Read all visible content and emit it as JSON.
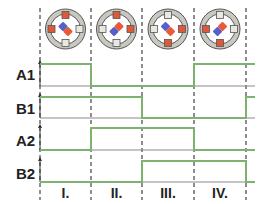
{
  "signals": [
    {
      "name": "A1",
      "label": "A1",
      "states": [
        1,
        0,
        0,
        1
      ],
      "high_y": 64,
      "low_y": 86,
      "label_y": 67
    },
    {
      "name": "B1",
      "label": "B1",
      "states": [
        1,
        1,
        0,
        0
      ],
      "high_y": 97,
      "low_y": 118,
      "label_y": 101
    },
    {
      "name": "A2",
      "label": "A2",
      "states": [
        0,
        1,
        1,
        0
      ],
      "high_y": 128,
      "low_y": 150,
      "label_y": 133
    },
    {
      "name": "B2",
      "label": "B2",
      "states": [
        0,
        0,
        1,
        1
      ],
      "high_y": 161,
      "low_y": 182,
      "label_y": 166
    }
  ],
  "phases": [
    {
      "label": "I.",
      "x_start": 40,
      "x_end": 91
    },
    {
      "label": "II.",
      "x_start": 91,
      "x_end": 142
    },
    {
      "label": "III.",
      "x_start": 142,
      "x_end": 194
    },
    {
      "label": "IV.",
      "x_start": 194,
      "x_end": 246
    }
  ],
  "after_last": {
    "A1": 1,
    "B1": 1,
    "A2": 0,
    "B2": 0,
    "x_end": 255
  },
  "motors": [
    {
      "phase": "I.",
      "energized": [
        "top",
        "left"
      ],
      "rotor_angle": 45
    },
    {
      "phase": "II.",
      "energized": [
        "top",
        "right"
      ],
      "rotor_angle": -45
    },
    {
      "phase": "III.",
      "energized": [
        "right",
        "bottom"
      ],
      "rotor_angle": 45
    },
    {
      "phase": "IV.",
      "energized": [
        "left",
        "bottom"
      ],
      "rotor_angle": -45
    }
  ],
  "colors": {
    "waveform": "#7db36f",
    "baseline": "#8a8a8a",
    "divider": "#444444",
    "stator_ring": "#c8c8c0",
    "stator_ring_stroke": "#555555",
    "pole_active": "#e0583a",
    "pole_inactive": "#e8e8e0",
    "rotor_red": "#e85a3a",
    "rotor_blue": "#5560c8"
  }
}
